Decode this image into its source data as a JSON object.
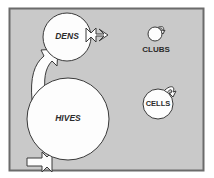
{
  "canvas": {
    "width": 214,
    "height": 178,
    "outer_background": "#ffffff",
    "panel_background": "#c9c9c9",
    "panel_border_color": "#6b6b6b",
    "shape_fill": "#fdfdfd",
    "shape_stroke": "#3a3a3a",
    "label_color": "#2b2b2b"
  },
  "diagram": {
    "type": "stock-and-flow",
    "nodes": [
      {
        "id": "dens",
        "label": "DENS",
        "label_style": "italic",
        "label_position": "inside",
        "shape": "circle",
        "cx": 67,
        "cy": 37,
        "r": 24,
        "font_size": 8.5
      },
      {
        "id": "hives",
        "label": "HIVES",
        "label_style": "italic",
        "label_position": "inside",
        "shape": "circle",
        "cx": 68,
        "cy": 119,
        "r": 41,
        "font_size": 8.5
      },
      {
        "id": "clubs",
        "label": "CLUBS",
        "label_style": "normal",
        "label_position": "below",
        "shape": "circle",
        "cx": 155,
        "cy": 34,
        "r": 7,
        "font_size": 8,
        "label_x": 156,
        "label_y": 50
      },
      {
        "id": "cells",
        "label": "CELLS",
        "label_style": "normal",
        "label_position": "inside",
        "shape": "circle",
        "cx": 158,
        "cy": 104,
        "r": 15,
        "font_size": 7.5
      }
    ],
    "flows": [
      {
        "id": "dens-outflow-right",
        "from": "dens",
        "direction": "right",
        "description": "outflow arrow pointing right from DENS"
      },
      {
        "id": "hives-to-dens",
        "from": "hives",
        "to": "dens",
        "direction": "up-right",
        "description": "curved flow arrow from HIVES up into DENS"
      },
      {
        "id": "hives-outflow-bottom-left",
        "from": "hives",
        "direction": "down-left",
        "description": "outflow arrow pointing down-left from HIVES"
      },
      {
        "id": "clubs-self-loop",
        "from": "clubs",
        "to": "clubs",
        "direction": "top-right",
        "description": "small hook loop at top-right of CLUBS"
      },
      {
        "id": "cells-self-loop",
        "from": "cells",
        "to": "cells",
        "direction": "top-right",
        "description": "small hook loop at top-right of CELLS"
      }
    ]
  }
}
